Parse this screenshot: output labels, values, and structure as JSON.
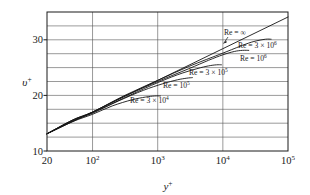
{
  "chart_data": {
    "type": "line",
    "title": "",
    "subtitle": "",
    "xlabel": "y+",
    "xlabel_base": "y",
    "xlabel_sup": "+",
    "ylabel": "v+",
    "ylabel_base": "υ",
    "ylabel_sup": "+",
    "xscale": "log",
    "yscale": "linear",
    "xlim": [
      20,
      100000
    ],
    "ylim": [
      10,
      35
    ],
    "grid": true,
    "grid_axis": "both",
    "legend_position": "inline-labels",
    "xticks": [
      {
        "value": 20,
        "label": "20",
        "base": "20",
        "sup": ""
      },
      {
        "value": 100,
        "label": "10^2",
        "base": "10",
        "sup": "2"
      },
      {
        "value": 1000,
        "label": "10^3",
        "base": "10",
        "sup": "3"
      },
      {
        "value": 10000,
        "label": "10^4",
        "base": "10",
        "sup": "4"
      },
      {
        "value": 100000,
        "label": "10^5",
        "base": "10",
        "sup": "5"
      }
    ],
    "yticks_labeled": [
      {
        "value": 10,
        "label": "10"
      },
      {
        "value": 20,
        "label": "20"
      },
      {
        "value": 30,
        "label": "30"
      }
    ],
    "ygridlines": [
      10,
      12.5,
      15,
      17.5,
      20,
      22.5,
      25,
      27.5,
      30,
      32.5,
      35
    ],
    "series": [
      {
        "name": "Re = ∞",
        "label_base": "Re = ",
        "label_value": "∞",
        "label_sup": "",
        "re_value": "infinity",
        "kind": "log-law-straight-line",
        "points": [
          [
            20,
            13.1
          ],
          [
            100,
            17.0
          ],
          [
            1000,
            22.7
          ],
          [
            10000,
            28.4
          ],
          [
            100000,
            34.1
          ]
        ]
      },
      {
        "name": "Re = 3 × 10^6",
        "label_base": "Re = 3 × 10",
        "label_value": "",
        "label_sup": "6",
        "re_value": 3000000,
        "kind": "wake-profile",
        "points": [
          [
            20,
            13.1
          ],
          [
            50,
            15.6
          ],
          [
            100,
            17.0
          ],
          [
            300,
            19.9
          ],
          [
            1000,
            22.7
          ],
          [
            3000,
            25.2
          ],
          [
            10000,
            27.6
          ],
          [
            20000,
            29.0
          ],
          [
            30000,
            29.7
          ],
          [
            45000,
            30.1
          ],
          [
            55000,
            30.1
          ]
        ]
      },
      {
        "name": "Re = 10^6",
        "label_base": "Re = 10",
        "label_value": "",
        "label_sup": "6",
        "re_value": 1000000,
        "kind": "wake-profile",
        "points": [
          [
            20,
            13.1
          ],
          [
            50,
            15.6
          ],
          [
            100,
            17.0
          ],
          [
            300,
            19.8
          ],
          [
            1000,
            22.5
          ],
          [
            3000,
            24.8
          ],
          [
            6000,
            26.3
          ],
          [
            10000,
            27.3
          ],
          [
            15000,
            27.9
          ],
          [
            20000,
            28.1
          ],
          [
            25000,
            28.1
          ]
        ]
      },
      {
        "name": "Re = 3 × 10^5",
        "label_base": "Re = 3 × 10",
        "label_value": "",
        "label_sup": "5",
        "re_value": 300000,
        "kind": "wake-profile",
        "points": [
          [
            20,
            13.1
          ],
          [
            50,
            15.5
          ],
          [
            100,
            16.9
          ],
          [
            300,
            19.5
          ],
          [
            800,
            21.8
          ],
          [
            2000,
            23.7
          ],
          [
            4000,
            24.8
          ],
          [
            6000,
            25.3
          ],
          [
            8000,
            25.5
          ],
          [
            9500,
            25.5
          ]
        ]
      },
      {
        "name": "Re = 10^5",
        "label_base": "Re = 10",
        "label_value": "",
        "label_sup": "5",
        "re_value": 100000,
        "kind": "wake-profile",
        "points": [
          [
            20,
            13.1
          ],
          [
            50,
            15.4
          ],
          [
            100,
            16.8
          ],
          [
            250,
            19.0
          ],
          [
            600,
            20.9
          ],
          [
            1200,
            22.1
          ],
          [
            2000,
            22.8
          ],
          [
            2800,
            23.1
          ],
          [
            3400,
            23.2
          ]
        ]
      },
      {
        "name": "Re = 3 × 10^4",
        "label_base": "Re = 3 × 10",
        "label_value": "",
        "label_sup": "4",
        "re_value": 30000,
        "kind": "wake-profile",
        "points": [
          [
            20,
            13.1
          ],
          [
            50,
            15.3
          ],
          [
            100,
            16.6
          ],
          [
            200,
            18.1
          ],
          [
            400,
            19.2
          ],
          [
            650,
            19.7
          ],
          [
            900,
            19.9
          ],
          [
            1100,
            19.9
          ]
        ]
      }
    ],
    "annotations": [
      {
        "name": "re-infinity-callout",
        "text": "Re = ∞",
        "base": "Re = ",
        "sup_symbol": "∞",
        "has_arrow": true,
        "arrow_target_x": 11000,
        "arrow_target_y": 28.6
      }
    ]
  },
  "labels": {
    "re_infinity": "Re = ",
    "re_infinity_symbol": "∞",
    "re_3e6_base": "Re = 3 × 10",
    "re_3e6_sup": "6",
    "re_1e6_base": "Re = 10",
    "re_1e6_sup": "6",
    "re_3e5_base": "Re = 3 × 10",
    "re_3e5_sup": "5",
    "re_1e5_base": "Re = 10",
    "re_1e5_sup": "5",
    "re_3e4_base": "Re = 3 × 10",
    "re_3e4_sup": "4"
  },
  "axis": {
    "x_title_base": "y",
    "x_title_sup": "+",
    "y_title_base": "υ",
    "y_title_sup": "+",
    "xtick_20": "20",
    "xtick_1e2_base": "10",
    "xtick_1e2_sup": "2",
    "xtick_1e3_base": "10",
    "xtick_1e3_sup": "3",
    "xtick_1e4_base": "10",
    "xtick_1e4_sup": "4",
    "xtick_1e5_base": "10",
    "xtick_1e5_sup": "5",
    "ytick_10": "10",
    "ytick_20": "20",
    "ytick_30": "30"
  },
  "colors": {
    "curve": "#151515",
    "grid": "#555555",
    "frame": "#1a1a1a",
    "background": "#ffffff",
    "text": "#1a1a1a"
  }
}
